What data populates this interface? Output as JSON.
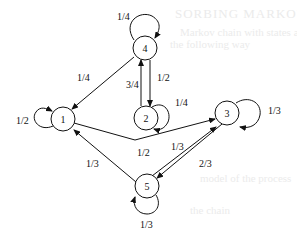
{
  "background_text": {
    "line1": "SORBING MARKOV CHAINS",
    "line2": "Markov chain with states and transitions",
    "line3": "the following way",
    "line4": "model of the process",
    "line5": "the chain"
  },
  "diagram": {
    "type": "markov-chain-state-diagram",
    "nodes": [
      {
        "id": "1",
        "label": "1"
      },
      {
        "id": "2",
        "label": "2"
      },
      {
        "id": "3",
        "label": "3"
      },
      {
        "id": "4",
        "label": "4"
      },
      {
        "id": "5",
        "label": "5"
      }
    ],
    "edges": [
      {
        "from": "4",
        "to": "4",
        "label": "1/4"
      },
      {
        "from": "4",
        "to": "1",
        "label": "1/4"
      },
      {
        "from": "4",
        "to": "2",
        "label": "1/2"
      },
      {
        "from": "2",
        "to": "4",
        "label": "3/4"
      },
      {
        "from": "2",
        "to": "2",
        "label": "1/4"
      },
      {
        "from": "1",
        "to": "1",
        "label": "1/2"
      },
      {
        "from": "1",
        "to": "3",
        "label": "1/2"
      },
      {
        "from": "3",
        "to": "3",
        "label": "1/3"
      },
      {
        "from": "3",
        "to": "5",
        "label": "2/3"
      },
      {
        "from": "5",
        "to": "3",
        "label": "1/3"
      },
      {
        "from": "5",
        "to": "1",
        "label": "1/3"
      },
      {
        "from": "5",
        "to": "5",
        "label": "1/3"
      }
    ]
  }
}
